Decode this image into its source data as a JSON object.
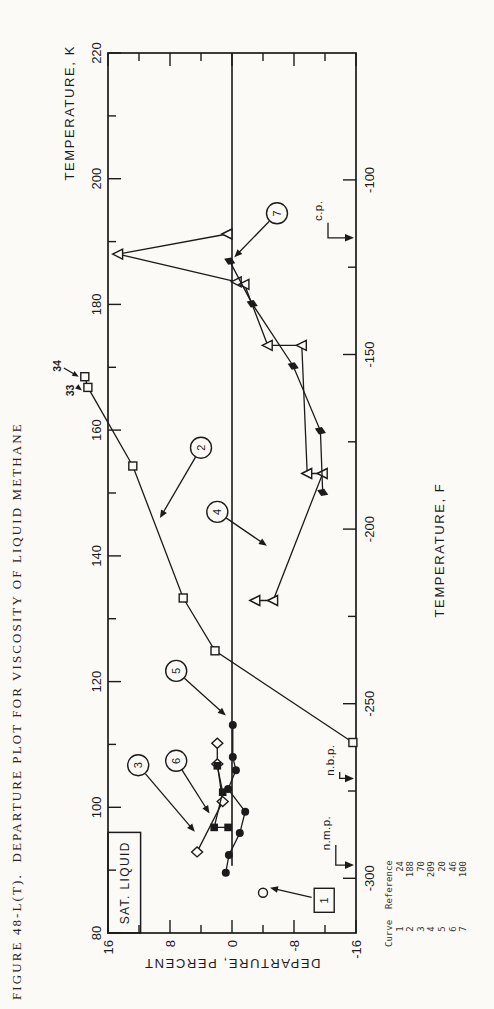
{
  "page": {
    "background": "#fbfaf7",
    "ink": "#1b1b1b"
  },
  "figure": {
    "caption": "FIGURE 48-L(T).  DEPARTURE PLOT FOR VISCOSITY OF LIQUID METHANE"
  },
  "legend": {
    "header": {
      "curve": "Curve",
      "reference": "Reference"
    },
    "rows": [
      {
        "curve": "1",
        "reference": "24"
      },
      {
        "curve": "2",
        "reference": "188"
      },
      {
        "curve": "3",
        "reference": "70"
      },
      {
        "curve": "4",
        "reference": "209"
      },
      {
        "curve": "5",
        "reference": "20"
      },
      {
        "curve": "6",
        "reference": "46"
      },
      {
        "curve": "7",
        "reference": "100"
      }
    ]
  },
  "chart_data": {
    "type": "scatter",
    "title": "FIGURE 48-L(T).  DEPARTURE PLOT FOR VISCOSITY OF LIQUID METHANE",
    "axes": {
      "top": {
        "label": "TEMPERATURE, K",
        "range": [
          80,
          220
        ],
        "major_ticks": [
          80,
          100,
          120,
          140,
          160,
          180,
          200,
          220
        ],
        "tick_labels": [
          "80",
          "100",
          "120",
          "140",
          "160",
          "180",
          "200",
          "220"
        ],
        "minor_ticks": [
          90,
          110,
          130,
          150,
          170,
          190,
          210
        ]
      },
      "bottom": {
        "label": "TEMPERATURE, F",
        "major_ticks": [
          -300,
          -250,
          -200,
          -150,
          -100
        ],
        "tick_labels": [
          "-300",
          "-250",
          "-200",
          "-150",
          "-100"
        ],
        "minor_ticks": [
          -275,
          -225,
          -175,
          -125
        ]
      },
      "left": {
        "label": "DEPARTURE, PERCENT",
        "range": [
          -16,
          16
        ],
        "major_ticks": [
          16,
          8,
          0,
          -8,
          -16
        ],
        "tick_labels": [
          "16",
          "8",
          "0",
          "-8",
          "-16"
        ],
        "minor_ticks": [
          12,
          4,
          -4,
          -12
        ]
      }
    },
    "zero_line": {
      "from_K": 90.7,
      "to_K": 220
    },
    "series": [
      {
        "curve": "1",
        "reference": "24",
        "marker": "circle-open",
        "points": [
          [
            86.4,
            -4.0
          ]
        ],
        "label": {
          "shape": "box",
          "text": "1",
          "K": 85.2,
          "pct": -11.9
        },
        "arrow_to": {
          "K": 87.2,
          "pct": -4.9
        }
      },
      {
        "curve": "2",
        "reference": "188",
        "marker": "square-open",
        "points": [
          [
            168.5,
            19.0
          ],
          [
            166.8,
            18.6
          ],
          [
            154.3,
            12.8
          ],
          [
            133.3,
            6.3
          ],
          [
            124.9,
            2.2
          ],
          [
            110.3,
            -15.6
          ]
        ],
        "label": {
          "shape": "circle",
          "text": "2",
          "K": 157.2,
          "pct": 4.0
        },
        "arrow_to": {
          "K": 146.0,
          "pct": 9.3
        },
        "offscale_labels": [
          {
            "text": "34",
            "K": 170.2,
            "pct": 22.6,
            "point_index": 0
          },
          {
            "text": "33",
            "K": 166.3,
            "pct": 20.9,
            "point_index": 1
          }
        ]
      },
      {
        "curve": "3",
        "reference": "70",
        "marker": "diamond-open",
        "points": [
          [
            110.2,
            1.9
          ],
          [
            106.9,
            1.9
          ],
          [
            100.9,
            1.2
          ],
          [
            92.9,
            4.5
          ]
        ],
        "label": {
          "shape": "circle",
          "text": "3",
          "K": 106.7,
          "pct": 12.1
        },
        "arrow_to": {
          "K": 96.1,
          "pct": 4.8
        }
      },
      {
        "curve": "4",
        "reference": "209",
        "marker": "triangle-open",
        "points": [
          [
            191.2,
            0.6
          ],
          [
            188.0,
            14.7
          ],
          [
            183.6,
            -0.6
          ],
          [
            183.2,
            -1.6
          ],
          [
            173.5,
            -4.6
          ],
          [
            173.5,
            -9.0
          ],
          [
            153.1,
            -9.7
          ],
          [
            153.1,
            -11.7
          ],
          [
            132.9,
            -5.3
          ],
          [
            132.9,
            -3.0
          ]
        ],
        "label": {
          "shape": "circle",
          "text": "4",
          "K": 147.0,
          "pct": 1.9
        },
        "arrow_to": {
          "K": 141.6,
          "pct": -4.5
        }
      },
      {
        "curve": "5",
        "reference": "20",
        "marker": "circle-filled",
        "points": [
          [
            113.1,
            -0.1
          ],
          [
            108.0,
            -0.1
          ],
          [
            105.9,
            -0.5
          ],
          [
            102.9,
            0.5
          ],
          [
            99.3,
            -1.7
          ],
          [
            95.9,
            -1.0
          ],
          [
            92.4,
            0.4
          ],
          [
            89.6,
            0.8
          ]
        ],
        "label": {
          "shape": "circle",
          "text": "5",
          "K": 121.7,
          "pct": 7.2
        },
        "arrow_to": {
          "K": 114.6,
          "pct": 0.8
        }
      },
      {
        "curve": "6",
        "reference": "46",
        "marker": "square-filled",
        "points": [
          [
            106.6,
            1.9
          ],
          [
            102.4,
            1.2
          ],
          [
            96.8,
            2.3
          ],
          [
            96.8,
            0.5
          ]
        ],
        "label": {
          "shape": "circle",
          "text": "6",
          "K": 107.4,
          "pct": 7.2
        },
        "arrow_to": {
          "K": 99.0,
          "pct": 2.9
        }
      },
      {
        "curve": "7",
        "reference": "100",
        "marker": "diamond-filled",
        "points": [
          [
            186.9,
            0.3
          ],
          [
            180.1,
            -2.6
          ],
          [
            170.2,
            -7.9
          ],
          [
            159.9,
            -11.4
          ],
          [
            150.1,
            -11.7
          ]
        ],
        "label": {
          "shape": "circle",
          "text": "7",
          "K": 194.5,
          "pct": -5.8
        },
        "arrow_to": {
          "K": 187.5,
          "pct": -0.3
        }
      }
    ],
    "annotations": {
      "sat_liquid": {
        "text": "SAT. LIQUID",
        "K0": 80,
        "K1": 96,
        "pct0": 16,
        "pct1": 11.8
      },
      "markers": [
        {
          "text": "n.m.p.",
          "text_K": 95.9,
          "text_pct": -12.1,
          "arrow_K": 90.8
        },
        {
          "text": "n.b.p.",
          "text_K": 107.5,
          "text_pct": -12.6,
          "arrow_K": 104.6
        },
        {
          "text": "c.p.",
          "text_K": 194.9,
          "text_pct": -11.1,
          "arrow_K": 190.6
        }
      ]
    }
  }
}
